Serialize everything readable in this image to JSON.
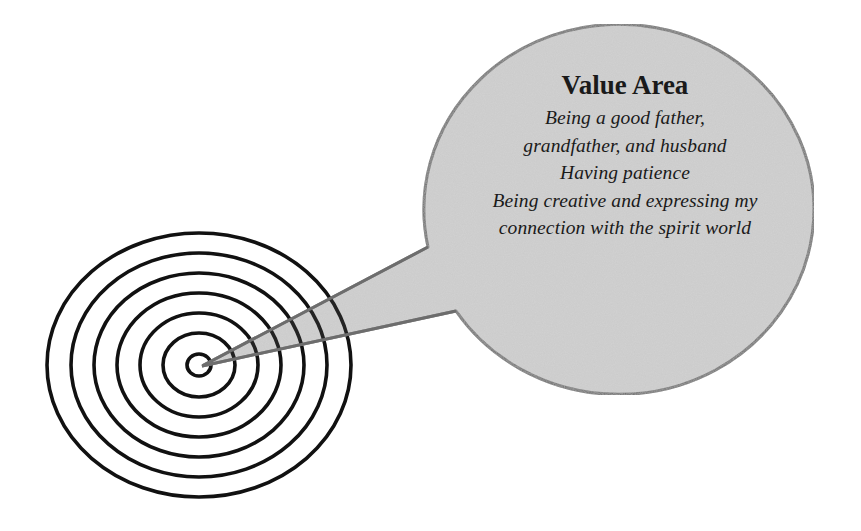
{
  "diagram": {
    "type": "target-with-speech-bubble",
    "target": {
      "ring_count": 7,
      "center": [
        200,
        365
      ],
      "ring_color": "#111111"
    },
    "bubble": {
      "fill_color": "#d0d0d0",
      "border_color": "#6e6e6e",
      "title": "Value Area",
      "lines": [
        "Being a good father,",
        "grandfather, and husband",
        "Having patience",
        "Being creative and expressing my",
        "connection with the spirit world"
      ]
    }
  }
}
